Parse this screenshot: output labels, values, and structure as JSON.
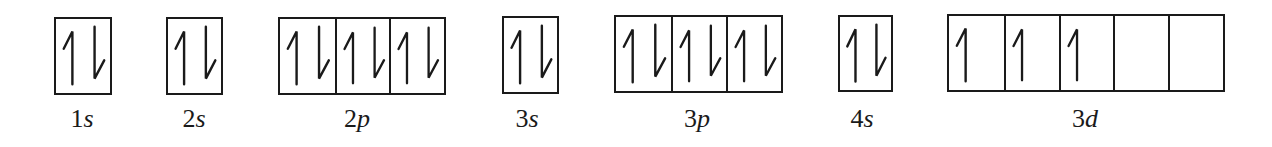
{
  "diagram": {
    "colors": {
      "line": "#1a1a1a",
      "background": "#ffffff"
    },
    "orbitals": [
      {
        "id": "1s",
        "number": "1",
        "letter": "s",
        "x": 54,
        "y": 17,
        "width": 58,
        "height": 78,
        "label_center_x": 82,
        "cells": [
          [
            "up",
            "down"
          ]
        ]
      },
      {
        "id": "2s",
        "number": "2",
        "letter": "s",
        "x": 166,
        "y": 17,
        "width": 57,
        "height": 78,
        "label_center_x": 194,
        "cells": [
          [
            "up",
            "down"
          ]
        ]
      },
      {
        "id": "2p",
        "number": "2",
        "letter": "p",
        "x": 278,
        "y": 17,
        "width": 168,
        "height": 78,
        "label_center_x": 357,
        "cells": [
          [
            "up",
            "down"
          ],
          [
            "up",
            "down"
          ],
          [
            "up",
            "down"
          ]
        ]
      },
      {
        "id": "3s",
        "number": "3",
        "letter": "s",
        "x": 502,
        "y": 16,
        "width": 57,
        "height": 78,
        "label_center_x": 527,
        "cells": [
          [
            "up",
            "down"
          ]
        ]
      },
      {
        "id": "3p",
        "number": "3",
        "letter": "p",
        "x": 614,
        "y": 15,
        "width": 169,
        "height": 78,
        "label_center_x": 697,
        "cells": [
          [
            "up",
            "down"
          ],
          [
            "up",
            "down"
          ],
          [
            "up",
            "down"
          ]
        ]
      },
      {
        "id": "4s",
        "number": "4",
        "letter": "s",
        "x": 838,
        "y": 15,
        "width": 55,
        "height": 77,
        "label_center_x": 862,
        "cells": [
          [
            "up",
            "down"
          ]
        ]
      },
      {
        "id": "3d",
        "number": "3",
        "letter": "d",
        "x": 947,
        "y": 14,
        "width": 278,
        "height": 78,
        "label_center_x": 1085,
        "cells": [
          [
            "up"
          ],
          [
            "up"
          ],
          [
            "up"
          ],
          [],
          []
        ]
      }
    ],
    "labels": {
      "1s": {
        "number": "1",
        "letter": "s"
      },
      "2s": {
        "number": "2",
        "letter": "s"
      },
      "2p": {
        "number": "2",
        "letter": "p"
      },
      "3s": {
        "number": "3",
        "letter": "s"
      },
      "3p": {
        "number": "3",
        "letter": "p"
      },
      "4s": {
        "number": "4",
        "letter": "s"
      },
      "3d": {
        "number": "3",
        "letter": "d"
      }
    },
    "electron_counts": {
      "1s": 2,
      "2s": 2,
      "2p": 6,
      "3s": 2,
      "3p": 6,
      "4s": 2,
      "3d": 3
    }
  }
}
